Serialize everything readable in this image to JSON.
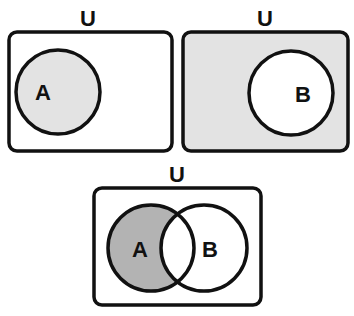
{
  "diagram": {
    "type": "venn",
    "colors": {
      "stroke": "#111111",
      "light_fill": "#e3e3e3",
      "dark_fill": "#b3b3b3",
      "background": "#ffffff"
    },
    "panels": [
      {
        "id": "set-a",
        "universe_label": "U",
        "sets": [
          {
            "label": "A",
            "shaded": true
          }
        ],
        "shaded_region": "A"
      },
      {
        "id": "complement-b",
        "universe_label": "U",
        "sets": [
          {
            "label": "B",
            "shaded": false
          }
        ],
        "shaded_region": "U minus B (complement of B)"
      },
      {
        "id": "a-minus-b",
        "universe_label": "U",
        "sets": [
          {
            "label": "A",
            "shaded": true
          },
          {
            "label": "B",
            "shaded": false
          }
        ],
        "shaded_region": "A minus B (A ∩ B')"
      }
    ]
  }
}
